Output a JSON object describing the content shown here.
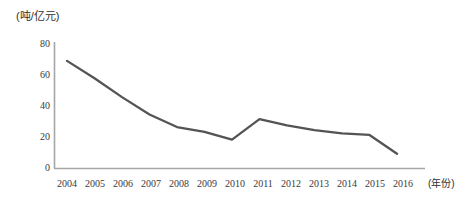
{
  "chart_data": {
    "type": "line",
    "title": "",
    "subtitle": "",
    "unit_label": "(吨/亿元)",
    "xlabel": "(年份)",
    "ylabel": "",
    "categories": [
      "2004",
      "2005",
      "2006",
      "2007",
      "2008",
      "2009",
      "2010",
      "2011",
      "2012",
      "2013",
      "2014",
      "2015",
      "2016"
    ],
    "values": [
      68,
      57,
      45,
      34,
      26,
      23,
      18,
      31,
      27,
      24,
      22,
      21,
      9
    ],
    "series": [
      {
        "name": "",
        "values": [
          68,
          57,
          45,
          34,
          26,
          23,
          18,
          31,
          27,
          24,
          22,
          21,
          9
        ]
      }
    ],
    "ylim": [
      0,
      80
    ],
    "yticks": [
      0,
      20,
      40,
      60,
      80
    ],
    "ytick_labels": [
      "0",
      "20",
      "40",
      "60",
      "80"
    ],
    "grid": false,
    "legend": "none",
    "line_color": "#545454",
    "axis_color": "#a6a6a6",
    "markers": false,
    "annotations": []
  }
}
